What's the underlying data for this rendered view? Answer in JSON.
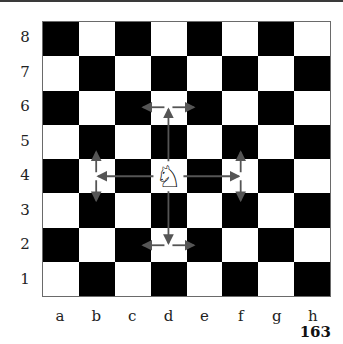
{
  "diagram": {
    "files": [
      "a",
      "b",
      "c",
      "d",
      "e",
      "f",
      "g",
      "h"
    ],
    "ranks": [
      "8",
      "7",
      "6",
      "5",
      "4",
      "3",
      "2",
      "1"
    ],
    "top_left_square_color": "dark",
    "piece": {
      "type": "knight",
      "color": "white",
      "square": "d4",
      "glyph": "♘"
    },
    "move_targets": [
      "c6",
      "e6",
      "c2",
      "e2",
      "b5",
      "b3",
      "f5",
      "f3"
    ],
    "arrow_color": "#555555"
  },
  "page": {
    "number": "163"
  }
}
